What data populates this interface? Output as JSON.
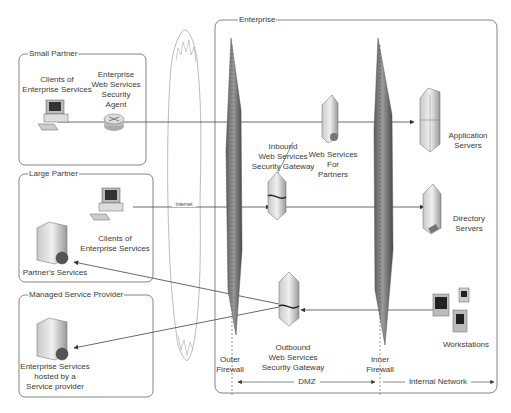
{
  "diagram": {
    "groups": {
      "small_partner": "Small Partner",
      "large_partner": "Large Partner",
      "managed_service_provider": "Managed Service Provider",
      "enterprise": "Enterprise"
    },
    "nodes": {
      "small_partner_clients": [
        "Clients of",
        "Enterprise Services"
      ],
      "security_agent": [
        "Enterprise",
        "Web Services",
        "Security",
        "Agent"
      ],
      "large_partner_clients": [
        "Clients of",
        "Enterprise Services"
      ],
      "partners_services": [
        "Partner's Services"
      ],
      "msp_services": [
        "Enterprise Services",
        "hosted by a",
        "Service provider"
      ],
      "inbound_gateway": [
        "Inbound",
        "Web Services",
        "Security Gateway"
      ],
      "web_services_for_partners": [
        "Web Services",
        "For",
        "Partners"
      ],
      "outbound_gateway": [
        "Outbound",
        "Web Services",
        "Security Gateway"
      ],
      "application_servers": [
        "Application",
        "Servers"
      ],
      "directory_servers": [
        "Directory",
        "Servers"
      ],
      "workstations": [
        "Workstations"
      ],
      "outer_firewall": [
        "Outer",
        "Firewall"
      ],
      "inner_firewall": [
        "Inner",
        "Firewall"
      ]
    },
    "edge_labels": {
      "internet": "Internet"
    },
    "zones": {
      "dmz": "DMZ",
      "internal_network": "Internal Network"
    },
    "icons": {
      "cloud": "internet-cloud-icon",
      "firewall": "firewall-icon",
      "desktop": "desktop-computer-icon",
      "router": "router-icon",
      "server": "server-tower-icon",
      "gateway": "security-gateway-icon",
      "workstation": "workstation-icon"
    },
    "colors": {
      "line": "#444444",
      "box_border": "#666666",
      "firewall": "#6f6f6f"
    }
  }
}
